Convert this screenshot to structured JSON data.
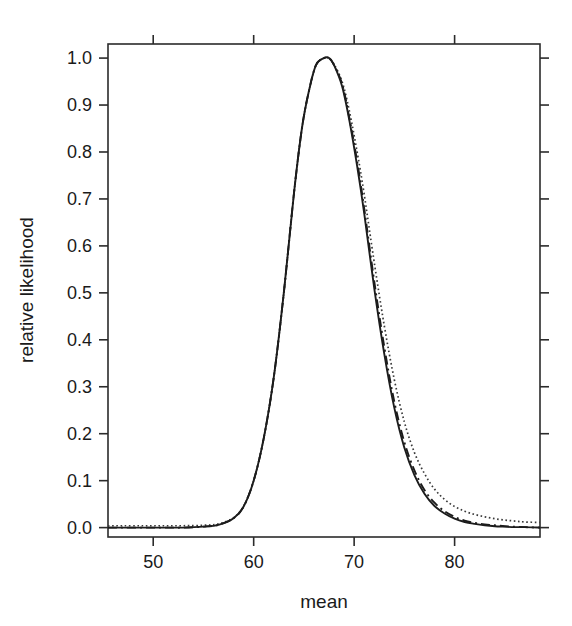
{
  "chart_data": {
    "type": "line",
    "title": "",
    "xlabel": "mean",
    "ylabel": "relative likelihood",
    "xlim": [
      45.5,
      88.5
    ],
    "ylim": [
      -0.02,
      1.03
    ],
    "xticks": [
      50,
      60,
      70,
      80
    ],
    "yticks": [
      0.0,
      0.1,
      0.2,
      0.3,
      0.4,
      0.5,
      0.6,
      0.7,
      0.8,
      0.9,
      1.0
    ],
    "xtick_labels": [
      "50",
      "60",
      "70",
      "80"
    ],
    "ytick_labels": [
      "0.0",
      "0.1",
      "0.2",
      "0.3",
      "0.4",
      "0.5",
      "0.6",
      "0.7",
      "0.8",
      "0.9",
      "1.0"
    ],
    "grid": false,
    "legend": "none",
    "frame": "box",
    "tick_direction": "outward",
    "peak_x": 67.5,
    "peak_y": 1.0,
    "series": [
      {
        "name": "solid",
        "style": "solid",
        "color": "#1c1c1c",
        "x": [
          45.5,
          47,
          49,
          51,
          53,
          55,
          56.5,
          58,
          59,
          60,
          61,
          62,
          63,
          64,
          64.8,
          65.5,
          66.2,
          67,
          67.5,
          68,
          68.8,
          69.5,
          70.3,
          71,
          72,
          73,
          74,
          75,
          76,
          77,
          78,
          79,
          80,
          81,
          82,
          83,
          84,
          85,
          86,
          87,
          88.5
        ],
        "y": [
          0.0,
          0.0,
          0.0,
          0.0,
          0.0,
          0.002,
          0.006,
          0.02,
          0.045,
          0.1,
          0.19,
          0.32,
          0.5,
          0.71,
          0.85,
          0.93,
          0.985,
          1.0,
          1.0,
          0.985,
          0.94,
          0.87,
          0.77,
          0.67,
          0.51,
          0.37,
          0.255,
          0.17,
          0.112,
          0.072,
          0.046,
          0.03,
          0.019,
          0.012,
          0.008,
          0.005,
          0.003,
          0.002,
          0.001,
          0.001,
          0.0
        ]
      },
      {
        "name": "dashed",
        "style": "dashdot",
        "color": "#1c1c1c",
        "x": [
          45.5,
          47,
          49,
          51,
          53,
          55,
          56.5,
          58,
          59,
          60,
          61,
          62,
          63,
          64,
          64.8,
          65.5,
          66.2,
          67,
          67.5,
          68,
          68.8,
          69.5,
          70.3,
          71,
          72,
          73,
          74,
          75,
          76,
          77,
          78,
          79,
          80,
          81,
          82,
          83,
          84,
          85,
          86,
          87,
          88.5
        ],
        "y": [
          0.0,
          0.0,
          0.0,
          0.0,
          0.0,
          0.002,
          0.006,
          0.02,
          0.045,
          0.1,
          0.19,
          0.32,
          0.5,
          0.71,
          0.85,
          0.93,
          0.985,
          1.0,
          1.0,
          0.985,
          0.945,
          0.875,
          0.78,
          0.68,
          0.525,
          0.385,
          0.268,
          0.182,
          0.122,
          0.08,
          0.053,
          0.035,
          0.023,
          0.015,
          0.01,
          0.007,
          0.005,
          0.003,
          0.002,
          0.001,
          0.0
        ]
      },
      {
        "name": "dotted",
        "style": "dotted",
        "color": "#3a3a3a",
        "x": [
          45.5,
          47,
          49,
          51,
          53,
          55,
          56.5,
          58,
          59,
          60,
          61,
          62,
          63,
          64,
          64.8,
          65.5,
          66.2,
          67,
          67.5,
          68,
          68.8,
          69.5,
          70.3,
          71,
          72,
          73,
          74,
          75,
          76,
          77,
          78,
          79,
          80,
          81,
          82,
          83,
          84,
          85,
          86,
          87,
          88.5
        ],
        "y": [
          0.004,
          0.004,
          0.004,
          0.004,
          0.004,
          0.005,
          0.008,
          0.021,
          0.046,
          0.1,
          0.19,
          0.32,
          0.5,
          0.71,
          0.85,
          0.93,
          0.985,
          1.0,
          1.0,
          0.987,
          0.95,
          0.89,
          0.8,
          0.71,
          0.565,
          0.43,
          0.315,
          0.225,
          0.16,
          0.115,
          0.082,
          0.06,
          0.045,
          0.035,
          0.028,
          0.023,
          0.019,
          0.016,
          0.014,
          0.012,
          0.011
        ]
      }
    ]
  }
}
